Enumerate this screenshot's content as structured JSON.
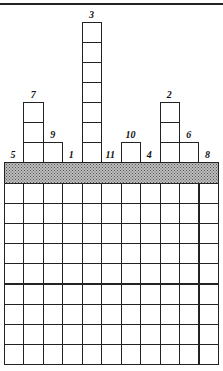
{
  "puzzle": {
    "columns": 11,
    "rows_below_bar": 9,
    "column_labels": [
      "5",
      "7",
      "9",
      "1",
      "3",
      "11",
      "10",
      "4",
      "2",
      "6",
      "8"
    ],
    "column_stack_heights": [
      0,
      3,
      1,
      0,
      7,
      0,
      1,
      0,
      3,
      1,
      0
    ],
    "bar_shading": "stippled-gray"
  },
  "colors": {
    "line": "#222222",
    "bar": "#bdbdbd",
    "background": "#ffffff"
  }
}
